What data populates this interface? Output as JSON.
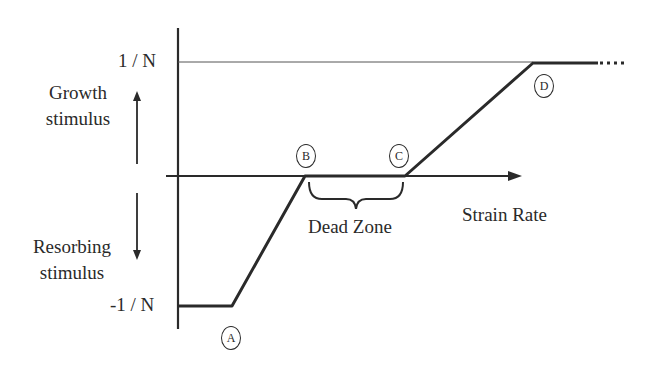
{
  "diagram": {
    "y_axis": {
      "top_label": "1 / N",
      "bottom_label": "-1 / N",
      "upper_annotation": [
        "Growth",
        "stimulus"
      ],
      "lower_annotation": [
        "Resorbing",
        "stimulus"
      ]
    },
    "x_axis": {
      "label": "Strain Rate"
    },
    "points": [
      {
        "id": "A",
        "label": "A"
      },
      {
        "id": "B",
        "label": "B"
      },
      {
        "id": "C",
        "label": "C"
      },
      {
        "id": "D",
        "label": "D"
      }
    ],
    "regions": {
      "dead_zone": "Dead Zone"
    },
    "colors": {
      "ink": "#2a2a2a",
      "background": "#ffffff"
    }
  }
}
